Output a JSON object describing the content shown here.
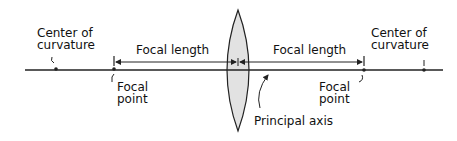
{
  "diagram": {
    "type": "converging-lens",
    "labels": {
      "center_left": [
        "Center of",
        "curvature"
      ],
      "center_right": [
        "Center of",
        "curvature"
      ],
      "focal_length_left": "Focal length",
      "focal_length_right": "Focal length",
      "focal_point_left": [
        "Focal",
        "point"
      ],
      "focal_point_right": [
        "Focal",
        "point"
      ],
      "principal_axis": "Principal axis"
    },
    "colors": {
      "line": "#222222",
      "lens_fill": "#e2e2e2"
    }
  }
}
